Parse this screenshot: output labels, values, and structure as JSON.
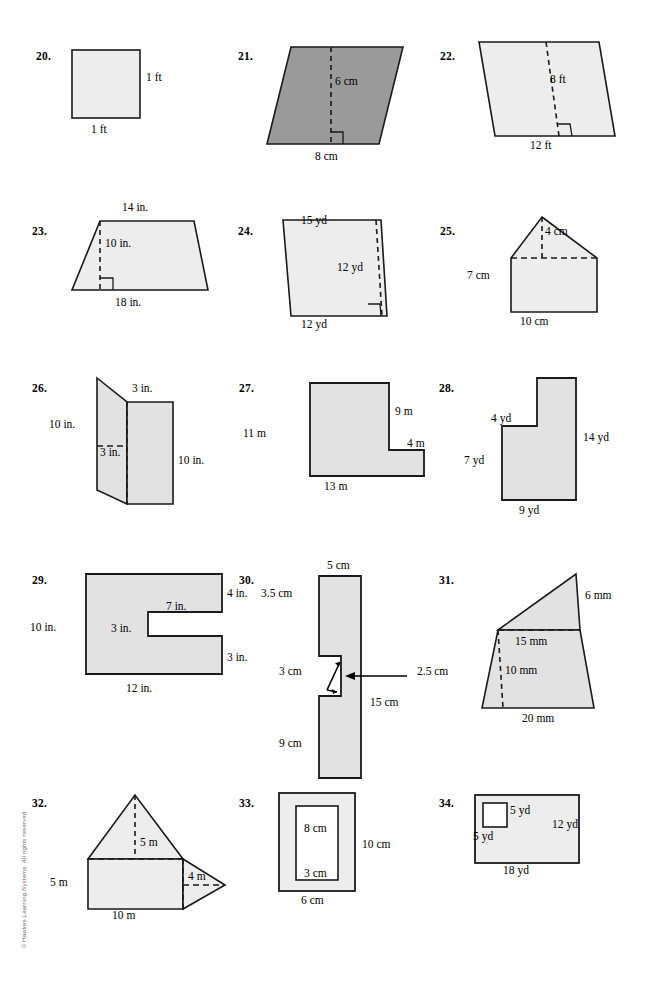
{
  "page": {
    "copyright": "© Hawkes Learning Systems. All rights reserved.",
    "colors": {
      "fill_light": "#ededed",
      "fill_medium": "#e2e2e2",
      "fill_dark": "#9a9a9a",
      "stroke": "#1a1a1a",
      "white": "#ffffff"
    }
  },
  "problems": [
    {
      "number": "20.",
      "shape": "square",
      "fill": "light",
      "labels": [
        {
          "text": "1 ft",
          "name": "label-right-side"
        },
        {
          "text": "1 ft",
          "name": "label-bottom-side"
        }
      ]
    },
    {
      "number": "21.",
      "shape": "parallelogram-right",
      "fill": "dark",
      "labels": [
        {
          "text": "6 cm",
          "name": "label-height"
        },
        {
          "text": "8 cm",
          "name": "label-base"
        }
      ]
    },
    {
      "number": "22.",
      "shape": "parallelogram-left",
      "fill": "light",
      "labels": [
        {
          "text": "8 ft",
          "name": "label-height"
        },
        {
          "text": "12 ft",
          "name": "label-base"
        }
      ]
    },
    {
      "number": "23.",
      "shape": "trapezoid",
      "fill": "light",
      "labels": [
        {
          "text": "14 in.",
          "name": "label-top-base"
        },
        {
          "text": "10 in.",
          "name": "label-height"
        },
        {
          "text": "18 in.",
          "name": "label-bottom-base"
        }
      ]
    },
    {
      "number": "24.",
      "shape": "trapezoid-inverted",
      "fill": "light",
      "labels": [
        {
          "text": "15 yd",
          "name": "label-top-base"
        },
        {
          "text": "12 yd",
          "name": "label-height"
        },
        {
          "text": "12 yd",
          "name": "label-bottom-base"
        }
      ]
    },
    {
      "number": "25.",
      "shape": "house-pentagon",
      "fill": "light",
      "labels": [
        {
          "text": "4 cm",
          "name": "label-triangle-height"
        },
        {
          "text": "7 cm",
          "name": "label-left-side"
        },
        {
          "text": "10 cm",
          "name": "label-base"
        }
      ]
    },
    {
      "number": "26.",
      "shape": "parallelogram-plus-rectangle",
      "fill": "medium",
      "labels": [
        {
          "text": "3 in.",
          "name": "label-top-width"
        },
        {
          "text": "10 in.",
          "name": "label-left-height"
        },
        {
          "text": "3 in.",
          "name": "label-inner-width"
        },
        {
          "text": "10 in.",
          "name": "label-right-height"
        }
      ]
    },
    {
      "number": "27.",
      "shape": "l-shape-step-right",
      "fill": "medium",
      "labels": [
        {
          "text": "11 m",
          "name": "label-left-height"
        },
        {
          "text": "9 m",
          "name": "label-right-upper"
        },
        {
          "text": "4 m",
          "name": "label-step-width"
        },
        {
          "text": "13 m",
          "name": "label-bottom-width"
        }
      ]
    },
    {
      "number": "28.",
      "shape": "l-shape-notch-upper-left",
      "fill": "medium",
      "labels": [
        {
          "text": "4 yd",
          "name": "label-notch-width"
        },
        {
          "text": "14 yd",
          "name": "label-right-height"
        },
        {
          "text": "7 yd",
          "name": "label-left-height"
        },
        {
          "text": "9 yd",
          "name": "label-bottom-width"
        }
      ]
    },
    {
      "number": "29.",
      "shape": "c-shape-notch-right",
      "fill": "medium",
      "labels": [
        {
          "text": "10 in.",
          "name": "label-left-height"
        },
        {
          "text": "4 in.",
          "name": "label-top-right-height"
        },
        {
          "text": "7 in.",
          "name": "label-notch-width"
        },
        {
          "text": "3 in.",
          "name": "label-notch-height"
        },
        {
          "text": "3 in.",
          "name": "label-bottom-right-height"
        },
        {
          "text": "12 in.",
          "name": "label-bottom-width"
        }
      ]
    },
    {
      "number": "30.",
      "shape": "tall-rectangle-notch-left",
      "fill": "medium",
      "labels": [
        {
          "text": "5 cm",
          "name": "label-top-width"
        },
        {
          "text": "3.5 cm",
          "name": "label-upper-left-height"
        },
        {
          "text": "3 cm",
          "name": "label-notch-height"
        },
        {
          "text": "2.5 cm",
          "name": "label-notch-width"
        },
        {
          "text": "15 cm",
          "name": "label-right-height"
        },
        {
          "text": "9 cm",
          "name": "label-lower-left-height"
        }
      ]
    },
    {
      "number": "31.",
      "shape": "triangle-on-trapezoid",
      "fill": "medium",
      "labels": [
        {
          "text": "6 mm",
          "name": "label-right-side"
        },
        {
          "text": "15 mm",
          "name": "label-middle-width"
        },
        {
          "text": "10 mm",
          "name": "label-height"
        },
        {
          "text": "20 mm",
          "name": "label-bottom-width"
        }
      ]
    },
    {
      "number": "32.",
      "shape": "rectangle-two-triangles",
      "fill": "light",
      "labels": [
        {
          "text": "5 m",
          "name": "label-top-triangle-height"
        },
        {
          "text": "5 m",
          "name": "label-left-height"
        },
        {
          "text": "4 m",
          "name": "label-right-triangle-height"
        },
        {
          "text": "10 m",
          "name": "label-bottom-width"
        }
      ]
    },
    {
      "number": "33.",
      "shape": "rectangle-with-inner-rectangle",
      "fill": "light",
      "labels": [
        {
          "text": "8 cm",
          "name": "label-inner-height"
        },
        {
          "text": "10 cm",
          "name": "label-outer-height"
        },
        {
          "text": "3 cm",
          "name": "label-inner-width"
        },
        {
          "text": "6 cm",
          "name": "label-outer-width"
        }
      ]
    },
    {
      "number": "34.",
      "shape": "rectangle-with-square-cutout",
      "fill": "light",
      "labels": [
        {
          "text": "5 yd",
          "name": "label-square-side-right"
        },
        {
          "text": "12 yd",
          "name": "label-outer-height"
        },
        {
          "text": "5 yd",
          "name": "label-square-side-bottom"
        },
        {
          "text": "18 yd",
          "name": "label-outer-width"
        }
      ]
    }
  ]
}
